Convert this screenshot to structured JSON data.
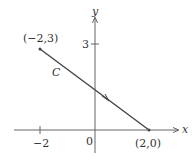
{
  "diagram": {
    "axes": {
      "x_label": "x",
      "y_label": "y",
      "origin_label": "0"
    },
    "ticks": {
      "x": [
        {
          "value": -2,
          "label": "−2"
        }
      ],
      "y": [
        {
          "value": 3,
          "label": "3"
        }
      ]
    },
    "curve": {
      "name": "C",
      "start": {
        "x": -2,
        "y": 3,
        "label": "(−2,3)"
      },
      "end": {
        "x": 2,
        "y": 0,
        "label": "(2,0)"
      },
      "direction": "from (-2,3) toward (2,0)"
    },
    "colors": {
      "line": "#444444",
      "axis": "#555555",
      "text": "#333333"
    }
  }
}
